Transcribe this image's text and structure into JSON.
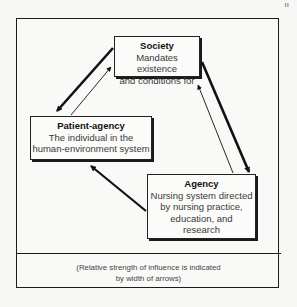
{
  "diagram": {
    "type": "concept-relationship",
    "nodes": [
      {
        "id": "society",
        "title": "Society",
        "lines": [
          "Mandates existence",
          "and conditions for"
        ]
      },
      {
        "id": "patient",
        "title": "Patient-agency",
        "lines": [
          "The individual in the",
          "human-environment system"
        ]
      },
      {
        "id": "agency",
        "title": "Agency",
        "lines": [
          "Nursing system directed",
          "by nursing practice,",
          "education, and",
          "research"
        ]
      }
    ],
    "edges": [
      {
        "from": "society",
        "to": "patient",
        "strength": "strong"
      },
      {
        "from": "patient",
        "to": "society",
        "strength": "weak"
      },
      {
        "from": "society",
        "to": "agency",
        "strength": "strong"
      },
      {
        "from": "agency",
        "to": "society",
        "strength": "weak"
      },
      {
        "from": "agency",
        "to": "patient",
        "strength": "strong"
      }
    ],
    "note": [
      "(Relative strength of influence is indicated",
      "by width of arrows)"
    ],
    "page_mark": "ıı"
  }
}
